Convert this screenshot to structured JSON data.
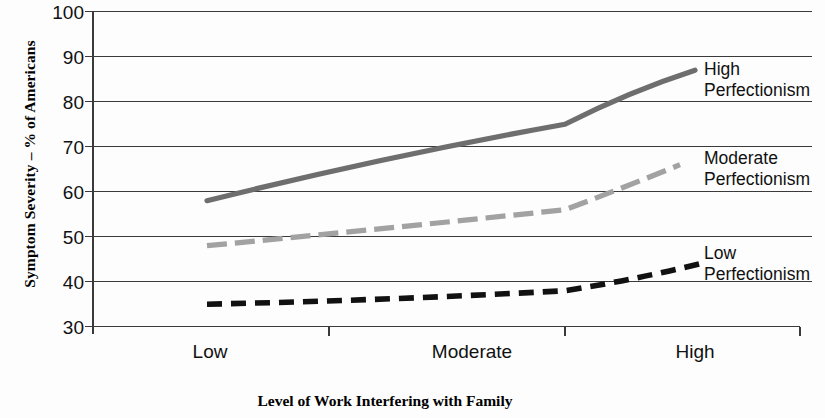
{
  "chart_data": {
    "type": "line",
    "title": "",
    "xlabel": "Level of Work Interfering with Family",
    "ylabel": "Symptom Severity – % of Americans",
    "categories": [
      "Low",
      "Moderate",
      "High"
    ],
    "xticklabels": [
      "Low",
      "Moderate",
      "High"
    ],
    "yticklabels": [
      "100",
      "90",
      "80",
      "70",
      "60",
      "50",
      "40",
      "30"
    ],
    "ylim": [
      30,
      100
    ],
    "ytick_step": 10,
    "grid": "horizontal",
    "legend_position": "right-inline-labels",
    "series": [
      {
        "name": "High Perfectionism",
        "label_line1": "High",
        "label_line2": "Perfectionism",
        "style": "solid",
        "color": "#6e6e6e",
        "values": [
          58,
          75,
          87
        ],
        "points": [
          {
            "x": "Low",
            "y": 58
          },
          {
            "x": "Moderate",
            "y": 75
          },
          {
            "x": "High",
            "y": 87
          }
        ]
      },
      {
        "name": "Moderate Perfectionism",
        "label_line1": "Moderate",
        "label_line2": "Perfectionism",
        "style": "dashed-long",
        "color": "#a2a2a2",
        "values": [
          48,
          56,
          66
        ],
        "points": [
          {
            "x": "Low",
            "y": 48
          },
          {
            "x": "Moderate",
            "y": 56
          },
          {
            "x": "High",
            "y": 66
          }
        ]
      },
      {
        "name": "Low Perfectionism",
        "label_line1": "Low",
        "label_line2": "Perfectionism",
        "style": "dashed-short",
        "color": "#111111",
        "values": [
          35,
          38,
          44
        ],
        "points": [
          {
            "x": "Low",
            "y": 35
          },
          {
            "x": "Moderate",
            "y": 38
          },
          {
            "x": "High",
            "y": 44
          }
        ]
      }
    ]
  },
  "yticks": [
    {
      "label": "100",
      "value": 100
    },
    {
      "label": "90",
      "value": 90
    },
    {
      "label": "80",
      "value": 80
    },
    {
      "label": "70",
      "value": 70
    },
    {
      "label": "60",
      "value": 60
    },
    {
      "label": "50",
      "value": 50
    },
    {
      "label": "40",
      "value": 40
    },
    {
      "label": "30",
      "value": 30
    }
  ],
  "xticks": [
    {
      "label": "Low"
    },
    {
      "label": "Moderate"
    },
    {
      "label": "High"
    }
  ],
  "axes": {
    "x_title": "Level of Work Interfering with Family",
    "y_title": "Symptom Severity – % of Americans"
  },
  "series_labels": [
    {
      "line1": "High",
      "line2": "Perfectionism"
    },
    {
      "line1": "Moderate",
      "line2": "Perfectionism"
    },
    {
      "line1": "Low",
      "line2": "Perfectionism"
    }
  ]
}
